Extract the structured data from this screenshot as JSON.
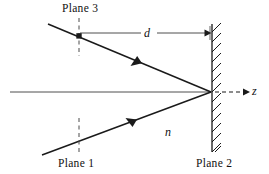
{
  "figure": {
    "type": "optical-ray-diagram",
    "width": 269,
    "height": 174,
    "background_color": "#ffffff",
    "stroke_color": "#1a1a1a"
  },
  "labels": {
    "plane3": "Plane 3",
    "plane1": "Plane 1",
    "plane2": "Plane 2",
    "distance": "d",
    "refractive_index": "n",
    "axis": "z"
  },
  "elements": {
    "mirror": {
      "name": "Plane 2",
      "kind": "hatched-wall",
      "x": 212,
      "y_top": 24,
      "y_bottom": 152,
      "hatch_direction": "up-right"
    },
    "optical_axis": {
      "kind": "solid-line",
      "x_start": 10,
      "x_end": 212,
      "y": 92
    },
    "z_axis": {
      "kind": "dashed-arrow",
      "x_start": 214,
      "x_end": 248,
      "y": 92,
      "arrow": "right"
    },
    "dimension_line": {
      "label": "d",
      "kind": "arrow-line",
      "x_start": 79,
      "x_end": 211,
      "y": 33,
      "arrow": "right",
      "gap_for_label": true
    },
    "incident_ray": {
      "description": "lower ray travelling toward mirror",
      "x_start": 42,
      "y_start": 155,
      "x_end": 211,
      "y_end": 92,
      "arrow_direction": "up-right",
      "arrow_at": 0.55
    },
    "reflected_ray": {
      "description": "upper ray travelling away from mirror",
      "x_start": 48,
      "y_start": 24,
      "x_end": 211,
      "y_end": 92,
      "arrow_direction": "down-left",
      "arrow_at": 0.45
    },
    "plane3_marker": {
      "kind": "dashed-vertical",
      "x": 79,
      "y_top": 18,
      "y_bottom": 56,
      "has_square_node": true,
      "node_x": 79,
      "node_y": 36
    },
    "plane1_marker": {
      "kind": "dashed-vertical",
      "x": 79,
      "y_top": 118,
      "y_bottom": 155
    }
  }
}
